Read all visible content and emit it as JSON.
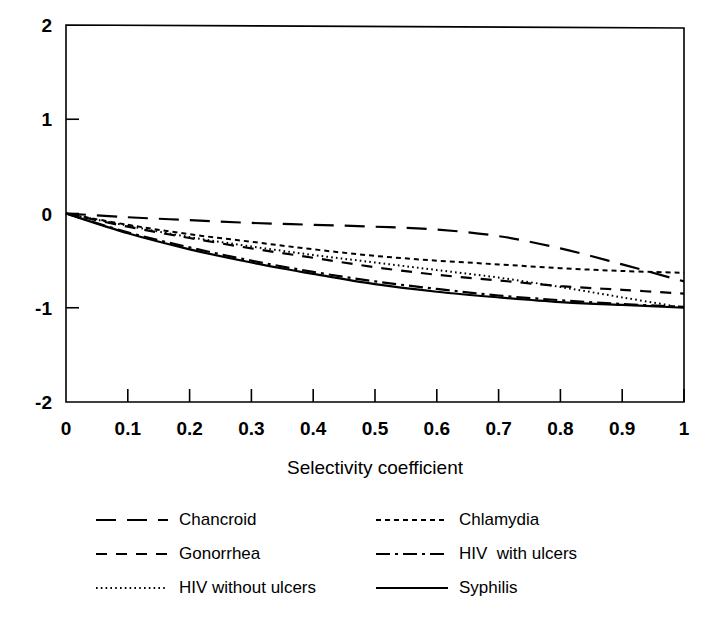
{
  "chart_data": {
    "type": "line",
    "title": "",
    "xlabel": "Selectivity coefficient",
    "ylabel": "",
    "xlim": [
      0,
      1
    ],
    "ylim": [
      -2,
      2
    ],
    "grid": false,
    "legend_position": "below",
    "xticks": [
      "0",
      "0.1",
      "0.2",
      "0.3",
      "0.4",
      "0.5",
      "0.6",
      "0.7",
      "0.8",
      "0.9",
      "1"
    ],
    "xtick_values": [
      0,
      0.1,
      0.2,
      0.3,
      0.4,
      0.5,
      0.6,
      0.7,
      0.8,
      0.9,
      1
    ],
    "yticks": [
      "2",
      "1",
      "0",
      "-1",
      "-2"
    ],
    "ytick_values": [
      2,
      1,
      0,
      -1,
      -2
    ],
    "x": [
      0,
      0.1,
      0.2,
      0.3,
      0.4,
      0.5,
      0.6,
      0.7,
      0.8,
      0.9,
      1.0
    ],
    "series": [
      {
        "name": "Chancroid",
        "style": "long-dash",
        "values": [
          0,
          -0.04,
          -0.07,
          -0.1,
          -0.12,
          -0.14,
          -0.17,
          -0.24,
          -0.37,
          -0.54,
          -0.72
        ]
      },
      {
        "name": "Chlamydia",
        "style": "fine-dash",
        "values": [
          0,
          -0.12,
          -0.22,
          -0.3,
          -0.38,
          -0.45,
          -0.5,
          -0.54,
          -0.58,
          -0.61,
          -0.63
        ]
      },
      {
        "name": "Gonorrhea",
        "style": "medium-dash",
        "values": [
          0,
          -0.14,
          -0.26,
          -0.37,
          -0.47,
          -0.57,
          -0.65,
          -0.71,
          -0.77,
          -0.81,
          -0.85
        ]
      },
      {
        "name": "HIV  with ulcers",
        "style": "dash-dot",
        "values": [
          0,
          -0.2,
          -0.36,
          -0.5,
          -0.62,
          -0.72,
          -0.8,
          -0.87,
          -0.92,
          -0.96,
          -0.99
        ]
      },
      {
        "name": "HIV without ulcers",
        "style": "dotted",
        "values": [
          0,
          -0.13,
          -0.25,
          -0.35,
          -0.44,
          -0.52,
          -0.6,
          -0.68,
          -0.78,
          -0.89,
          -1.0
        ]
      },
      {
        "name": "Syphilis",
        "style": "solid",
        "values": [
          0,
          -0.21,
          -0.38,
          -0.52,
          -0.64,
          -0.75,
          -0.83,
          -0.89,
          -0.94,
          -0.97,
          -1.0
        ]
      }
    ]
  },
  "axis": {
    "x_title": "Selectivity coefficient",
    "xticks": [
      "0",
      "0.1",
      "0.2",
      "0.3",
      "0.4",
      "0.5",
      "0.6",
      "0.7",
      "0.8",
      "0.9",
      "1"
    ],
    "yticks": [
      "2",
      "1",
      "0",
      "-1",
      "-2"
    ]
  },
  "legend": {
    "items": [
      {
        "label": "Chancroid",
        "style": "long-dash"
      },
      {
        "label": "Chlamydia",
        "style": "fine-dash"
      },
      {
        "label": "Gonorrhea",
        "style": "medium-dash"
      },
      {
        "label": "HIV  with ulcers",
        "style": "dash-dot"
      },
      {
        "label": "HIV without ulcers",
        "style": "dotted"
      },
      {
        "label": "Syphilis",
        "style": "solid"
      }
    ]
  },
  "colors": {
    "line": "#000000",
    "axis": "#000000",
    "background": "#ffffff"
  }
}
